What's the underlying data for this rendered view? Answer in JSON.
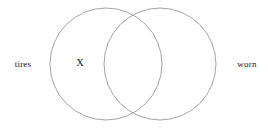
{
  "canvas": {
    "width": 268,
    "height": 128,
    "background_color": "#ffffff"
  },
  "diagram": {
    "type": "venn",
    "set_count": 2,
    "stroke_color": "#9a9a9a",
    "stroke_width": 0.9,
    "fill": "none",
    "text_color": "#1a1a1a",
    "circles": [
      {
        "id": "left",
        "cx": 106,
        "cy": 64,
        "r": 56
      },
      {
        "id": "right",
        "cx": 160,
        "cy": 64,
        "r": 56
      }
    ]
  },
  "labels": {
    "left": "tires",
    "right": "worn"
  },
  "markers": {
    "x_mark": "X",
    "x_region": "left-only"
  }
}
